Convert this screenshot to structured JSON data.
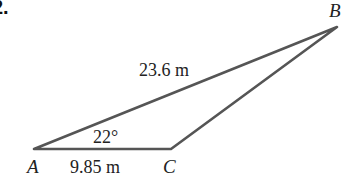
{
  "problem_number": "2.",
  "triangle": {
    "vertices": {
      "A": {
        "label": "A"
      },
      "B": {
        "label": "B"
      },
      "C": {
        "label": "C"
      }
    },
    "sides": {
      "AB": {
        "label": "23.6 m"
      },
      "AC": {
        "label": "9.85 m"
      }
    },
    "angles": {
      "A": {
        "label": "22°"
      }
    }
  },
  "colors": {
    "edge": "#555555",
    "text": "#222222",
    "background": "#ffffff"
  }
}
